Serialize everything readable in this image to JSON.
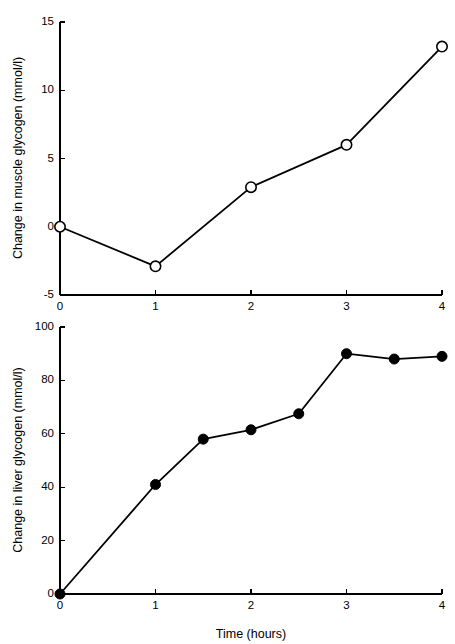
{
  "figure": {
    "background_color": "#ffffff",
    "line_color": "#000000",
    "shared_xlabel": "Time (hours)"
  },
  "chart_data": [
    {
      "id": "muscle-glycogen",
      "type": "line",
      "title": "",
      "xlabel": "",
      "ylabel": "Change in muscle glycogen (mmol/l)",
      "xlim": [
        0,
        4
      ],
      "ylim": [
        -5,
        15
      ],
      "xticks": [
        0,
        1,
        2,
        3,
        4
      ],
      "xticklabels": [
        "0",
        "1",
        "2",
        "3",
        "4"
      ],
      "yticks": [
        -5,
        0,
        5,
        10,
        15
      ],
      "yticklabels": [
        "-5",
        "0",
        "5",
        "10",
        "15"
      ],
      "grid": false,
      "legend": "none",
      "marker_style": "open-circle",
      "marker_fill": "#ffffff",
      "marker_stroke": "#000000",
      "x": [
        0,
        1,
        2,
        3,
        4
      ],
      "values": [
        0,
        -2.9,
        2.9,
        6.0,
        13.2
      ]
    },
    {
      "id": "liver-glycogen",
      "type": "line",
      "title": "",
      "xlabel": "Time (hours)",
      "ylabel": "Change in liver glycogen (mmol/l)",
      "xlim": [
        0,
        4
      ],
      "ylim": [
        0,
        100
      ],
      "xticks": [
        0,
        1,
        2,
        3,
        4
      ],
      "xticklabels": [
        "0",
        "1",
        "2",
        "3",
        "4"
      ],
      "yticks": [
        0,
        20,
        40,
        60,
        80,
        100
      ],
      "yticklabels": [
        "0",
        "20",
        "40",
        "60",
        "80",
        "100"
      ],
      "grid": false,
      "legend": "none",
      "marker_style": "filled-circle",
      "marker_fill": "#000000",
      "marker_stroke": "#000000",
      "x": [
        0,
        1,
        1.5,
        2,
        2.5,
        3,
        3.5,
        4
      ],
      "values": [
        0,
        41,
        58,
        61.5,
        67.5,
        90,
        88,
        89
      ]
    }
  ]
}
